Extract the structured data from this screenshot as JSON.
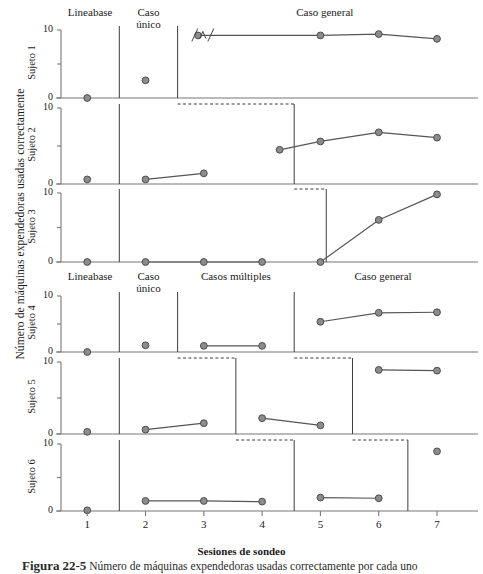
{
  "figure": {
    "ylabel": "Número de máquinas expendedoras usadas correctamente",
    "xlabel": "Sesiones de sondeo",
    "caption_prefix": "Figura",
    "caption_number": "22-5",
    "caption_text": "Número de máquinas expendedoras usadas correctamente por cada uno"
  },
  "axis": {
    "y_top_label": "10",
    "y_bottom_label": "0",
    "x_ticks": [
      "1",
      "2",
      "3",
      "4",
      "5",
      "6",
      "7"
    ]
  },
  "panels": [
    {
      "name": "Sujeto 1",
      "phase_labels": [
        "Lineabase",
        "Caso\núnico",
        "Caso general"
      ]
    },
    {
      "name": "Sujeto 2",
      "phase_labels": []
    },
    {
      "name": "Sujeto 3",
      "phase_labels": []
    },
    {
      "name": "Sujeto 4",
      "phase_labels": [
        "Lineabase",
        "Caso\núnico",
        "Casos múltiples",
        "Caso general"
      ]
    },
    {
      "name": "Sujeto 5",
      "phase_labels": []
    },
    {
      "name": "Sujeto 6",
      "phase_labels": []
    }
  ],
  "markers": {
    "fill": "#8c8c8c",
    "stroke": "#4d4d4d",
    "line": "#555555"
  },
  "chart_data": {
    "type": "line",
    "title": "Número de máquinas expendedoras usadas correctamente",
    "xlabel": "Sesiones de sondeo",
    "ylabel": "Número de máquinas expendedoras usadas correctamente",
    "xlim": [
      0.55,
      7.6
    ],
    "ylim": [
      0,
      10
    ],
    "x_ticks": [
      1,
      2,
      3,
      4,
      5,
      6,
      7
    ],
    "y_ticks": [
      0,
      5,
      10
    ],
    "grid": false,
    "legend": "none",
    "design": "multiple-baseline",
    "annotations": [
      {
        "panel": "Sujeto 1",
        "type": "axis-break",
        "x": 3.0,
        "y": 9.2,
        "text": "/\\/"
      }
    ],
    "series": [
      {
        "name": "Sujeto 1",
        "phases": [
          {
            "label": "Lineabase",
            "x_start": 0.55,
            "x_end": 1.55,
            "points": [
              {
                "x": 1,
                "y": 0
              }
            ]
          },
          {
            "label": "Caso único",
            "x_start": 1.55,
            "x_end": 2.55,
            "points": [
              {
                "x": 2,
                "y": 2.6
              }
            ]
          },
          {
            "label": "Caso general",
            "x_start": 2.55,
            "x_end": 7.6,
            "points": [
              {
                "x": 2.9,
                "y": 9.2
              },
              {
                "x": 5,
                "y": 9.2
              },
              {
                "x": 6,
                "y": 9.4
              },
              {
                "x": 7,
                "y": 8.7
              }
            ]
          }
        ]
      },
      {
        "name": "Sujeto 2",
        "phases": [
          {
            "label": "Lineabase",
            "x_start": 0.55,
            "x_end": 1.55,
            "points": [
              {
                "x": 1,
                "y": 0.6
              }
            ]
          },
          {
            "label": "Caso único",
            "x_start": 1.55,
            "x_end": 4.55,
            "points": [
              {
                "x": 2,
                "y": 0.6
              },
              {
                "x": 3,
                "y": 1.4
              }
            ]
          },
          {
            "label": "Caso general",
            "x_start": 4.55,
            "x_end": 7.6,
            "points": [
              {
                "x": 4.3,
                "y": 4.5
              },
              {
                "x": 5,
                "y": 5.6
              },
              {
                "x": 6,
                "y": 6.8
              },
              {
                "x": 7,
                "y": 6.1
              }
            ]
          }
        ]
      },
      {
        "name": "Sujeto 3",
        "phases": [
          {
            "label": "Lineabase",
            "x_start": 0.55,
            "x_end": 1.55,
            "points": [
              {
                "x": 1,
                "y": 0
              }
            ]
          },
          {
            "label": "Caso único",
            "x_start": 1.55,
            "x_end": 5.1,
            "points": [
              {
                "x": 2,
                "y": 0
              },
              {
                "x": 3,
                "y": 0
              },
              {
                "x": 4,
                "y": 0
              }
            ]
          },
          {
            "label": "Caso general",
            "x_start": 5.1,
            "x_end": 7.6,
            "points": [
              {
                "x": 5,
                "y": 0
              },
              {
                "x": 6,
                "y": 6.1
              },
              {
                "x": 7,
                "y": 9.8
              }
            ]
          }
        ]
      },
      {
        "name": "Sujeto 4",
        "phases": [
          {
            "label": "Lineabase",
            "x_start": 0.55,
            "x_end": 1.55,
            "points": [
              {
                "x": 1,
                "y": 0
              }
            ]
          },
          {
            "label": "Caso único",
            "x_start": 1.55,
            "x_end": 2.55,
            "points": [
              {
                "x": 2,
                "y": 1.2
              }
            ]
          },
          {
            "label": "Casos múltiples",
            "x_start": 2.55,
            "x_end": 4.55,
            "points": [
              {
                "x": 3,
                "y": 1.1
              },
              {
                "x": 4,
                "y": 1.1
              }
            ]
          },
          {
            "label": "Caso general",
            "x_start": 4.55,
            "x_end": 7.6,
            "points": [
              {
                "x": 5,
                "y": 5.4
              },
              {
                "x": 6,
                "y": 7.0
              },
              {
                "x": 7,
                "y": 7.1
              }
            ]
          }
        ]
      },
      {
        "name": "Sujeto 5",
        "phases": [
          {
            "label": "Lineabase",
            "x_start": 0.55,
            "x_end": 1.55,
            "points": [
              {
                "x": 1,
                "y": 0.3
              }
            ]
          },
          {
            "label": "Caso único",
            "x_start": 1.55,
            "x_end": 3.55,
            "points": [
              {
                "x": 2,
                "y": 0.6
              },
              {
                "x": 3,
                "y": 1.5
              }
            ]
          },
          {
            "label": "Casos múltiples",
            "x_start": 3.55,
            "x_end": 5.55,
            "points": [
              {
                "x": 4,
                "y": 2.2
              },
              {
                "x": 5,
                "y": 1.2
              }
            ]
          },
          {
            "label": "Caso general",
            "x_start": 5.55,
            "x_end": 7.6,
            "points": [
              {
                "x": 6,
                "y": 8.9
              },
              {
                "x": 7,
                "y": 8.8
              }
            ]
          }
        ]
      },
      {
        "name": "Sujeto 6",
        "phases": [
          {
            "label": "Lineabase",
            "x_start": 0.55,
            "x_end": 1.55,
            "points": [
              {
                "x": 1,
                "y": 0.1
              }
            ]
          },
          {
            "label": "Caso único",
            "x_start": 1.55,
            "x_end": 4.55,
            "points": [
              {
                "x": 2,
                "y": 1.5
              },
              {
                "x": 3,
                "y": 1.5
              },
              {
                "x": 4,
                "y": 1.4
              }
            ]
          },
          {
            "label": "Casos múltiples",
            "x_start": 4.55,
            "x_end": 6.5,
            "points": [
              {
                "x": 5,
                "y": 2.0
              },
              {
                "x": 6,
                "y": 1.9
              }
            ]
          },
          {
            "label": "Caso general",
            "x_start": 6.5,
            "x_end": 7.6,
            "points": [
              {
                "x": 7,
                "y": 8.9
              }
            ]
          }
        ]
      }
    ]
  }
}
